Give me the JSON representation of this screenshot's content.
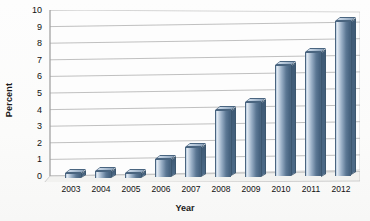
{
  "chart_data": {
    "type": "bar",
    "title": "",
    "xlabel": "Year",
    "ylabel": "Percent",
    "categories": [
      "2003",
      "2004",
      "2005",
      "2006",
      "2007",
      "2008",
      "2009",
      "2010",
      "2011",
      "2012"
    ],
    "values": [
      0.3,
      0.4,
      0.3,
      1.1,
      1.8,
      4.0,
      4.5,
      6.7,
      7.5,
      9.3
    ],
    "ylim": [
      0,
      10
    ],
    "yticks": [
      0,
      1,
      2,
      3,
      4,
      5,
      6,
      7,
      8,
      9,
      10
    ],
    "ytick_labels": [
      "0",
      "1",
      "2",
      "3",
      "4",
      "5",
      "6",
      "7",
      "8",
      "9",
      "10"
    ],
    "grid": true,
    "legend": "none",
    "style": "3d-column",
    "bar_color": "#6e89a6",
    "bar_highlight": "#dfe8f1",
    "bar_shadow": "#45617e",
    "gridline_color": "#b0b0b0",
    "axis_color": "#9a9a9a",
    "background": "#fcfcfb"
  }
}
